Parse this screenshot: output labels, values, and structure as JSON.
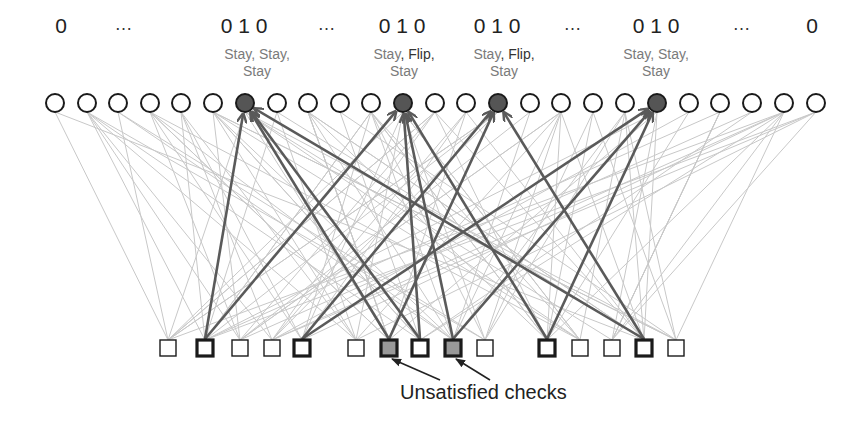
{
  "bits_row": [
    {
      "text": "0",
      "x": 61
    },
    {
      "text": "…",
      "x": 124,
      "dots": true
    },
    {
      "text": "0 1 0",
      "x": 244
    },
    {
      "text": "…",
      "x": 327,
      "dots": true
    },
    {
      "text": "0 1 0",
      "x": 402
    },
    {
      "text": "0 1 0",
      "x": 497
    },
    {
      "text": "…",
      "x": 573,
      "dots": true
    },
    {
      "text": "0 1 0",
      "x": 656
    },
    {
      "text": "…",
      "x": 742,
      "dots": true
    },
    {
      "text": "0",
      "x": 812
    }
  ],
  "messages": [
    {
      "x": 257,
      "line1a": "Stay, ",
      "line1b": "Stay,",
      "line1b_flip": false,
      "line2": "Stay"
    },
    {
      "x": 404,
      "line1a": "Stay",
      "line1b": ", Flip,",
      "line1b_flip": true,
      "line2": "Stay"
    },
    {
      "x": 504,
      "line1a": "Stay",
      "line1b": ", Flip,",
      "line1b_flip": true,
      "line2": "Stay"
    },
    {
      "x": 656,
      "line1a": "Stay, ",
      "line1b": "Stay,",
      "line1b_flip": false,
      "line2": "Stay"
    }
  ],
  "variable_nodes": {
    "y": 103,
    "radius": 9,
    "x": [
      55,
      87,
      118,
      150,
      181,
      213,
      245,
      277,
      308,
      340,
      371,
      403,
      435,
      466,
      498,
      530,
      561,
      593,
      625,
      657,
      689,
      720,
      752,
      784,
      816
    ],
    "highlighted": [
      6,
      11,
      14,
      19
    ]
  },
  "check_nodes": {
    "y": 348,
    "size": 16,
    "x": [
      168,
      205,
      240,
      272,
      302,
      356,
      389,
      420,
      453,
      485,
      547,
      580,
      612,
      644,
      676
    ],
    "bold": [
      1,
      4,
      7,
      10,
      13
    ],
    "unsatisfied": [
      6,
      8
    ]
  },
  "active_edges": [
    [
      1,
      6
    ],
    [
      1,
      11
    ],
    [
      4,
      14
    ],
    [
      4,
      19
    ],
    [
      6,
      14
    ],
    [
      6,
      6
    ],
    [
      7,
      6
    ],
    [
      7,
      11
    ],
    [
      8,
      11
    ],
    [
      8,
      19
    ],
    [
      10,
      11
    ],
    [
      10,
      19
    ],
    [
      13,
      6
    ],
    [
      13,
      14
    ]
  ],
  "caption": {
    "text": "Unsatisfied checks",
    "arrows_to_checks": [
      6,
      8
    ]
  },
  "colors": {
    "background": "#ffffff",
    "node_stroke": "#1a1a1a",
    "highlighted_fill": "#555555",
    "unsatisfied_fill": "#999999",
    "active_edge": "#5a5a5a",
    "passive_edge": "#c8c8c8",
    "message_text": "#7a7a7a"
  }
}
